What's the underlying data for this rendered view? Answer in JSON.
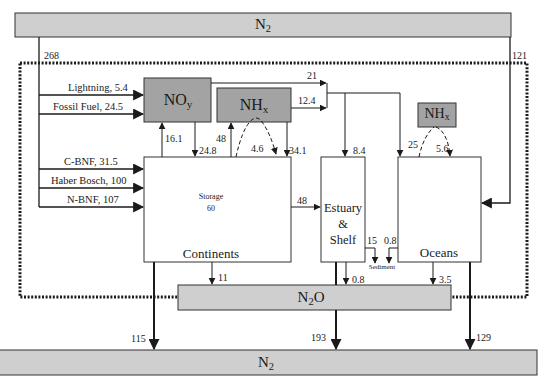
{
  "colors": {
    "n2_fill": "#cfcfcf",
    "reactive_fill": "#a3a3a3",
    "n2o_fill": "#cfcfcf",
    "line": "#1a1a1a",
    "background": "#ffffff"
  },
  "atmosphere_top": {
    "label_main": "N",
    "label_sub": "2"
  },
  "atmosphere_bottom": {
    "label_main": "N",
    "label_sub": "2"
  },
  "n2o": {
    "label_main": "N",
    "label_sub": "2",
    "label_tail": "O"
  },
  "noy": {
    "label_main": "NO",
    "label_sub": "y"
  },
  "nhx_land": {
    "label_main": "NH",
    "label_sub": "x"
  },
  "nhx_ocean": {
    "label_main": "NH",
    "label_sub": "x"
  },
  "continents": {
    "label": "Continents",
    "storage_label": "Storage",
    "storage_value": "60"
  },
  "estuary": {
    "line1": "Estuary",
    "line2": "&",
    "line3": "Shelf"
  },
  "oceans": {
    "label": "Oceans"
  },
  "sediment": {
    "label": "Sediment"
  },
  "sources": [
    {
      "label": "Lightning, 5.4"
    },
    {
      "label": "Fossil Fuel, 24.5"
    },
    {
      "label": "C-BNF,  31.5"
    },
    {
      "label": "Haber Bosch, 100"
    },
    {
      "label": "N-BNF,  107"
    }
  ],
  "flows": {
    "n2_to_land": "268",
    "n2_to_ocean": "121",
    "noy_to_sea": "21",
    "nhx_to_sea": "12.4",
    "land_to_noy": "16.1",
    "noy_to_land": "24.8",
    "land_to_nhx": "48",
    "nhx_recycle": "4.6",
    "nhx_to_land": "34.1",
    "atm_to_estuary": "8.4",
    "ocean_nhx_up": "25",
    "ocean_nhx_down": "5.6",
    "land_to_estuary": "48",
    "estuary_to_sediment": "15",
    "ocean_to_sediment": "0.8",
    "land_to_n2o": "11",
    "estuary_to_n2o": "0.8",
    "ocean_to_n2o": "3.5",
    "land_to_n2": "115",
    "estuary_to_n2": "193",
    "ocean_to_n2": "129"
  }
}
